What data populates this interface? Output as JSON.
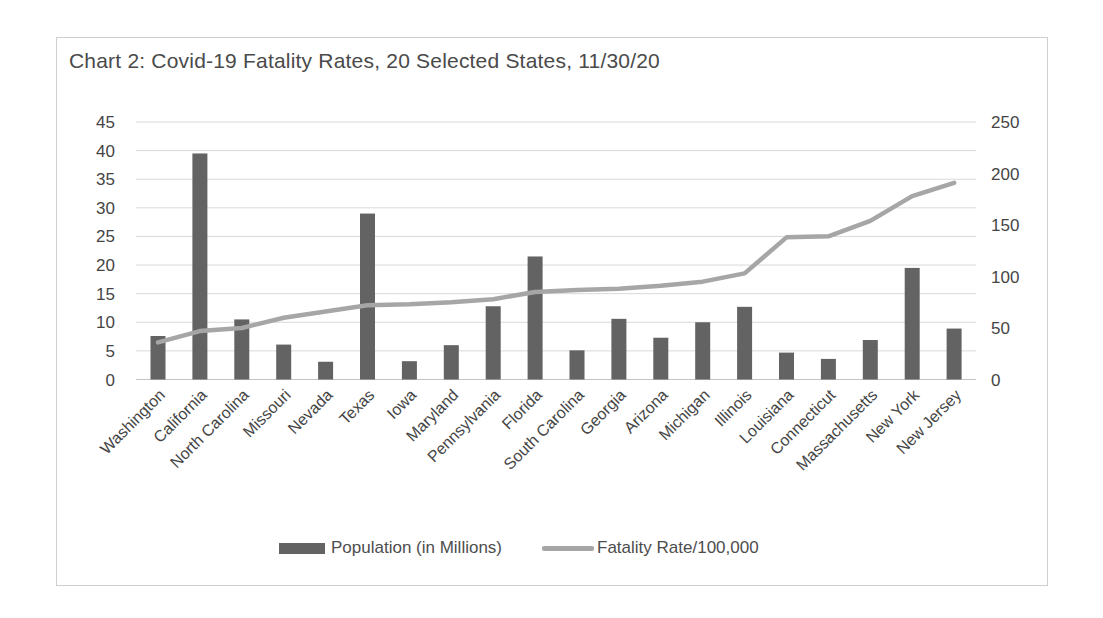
{
  "chart_data": {
    "type": "combo",
    "title": "Chart 2: Covid-19 Fatality Rates, 20 Selected States, 11/30/20",
    "categories": [
      "Washington",
      "California",
      "North Carolina",
      "Missouri",
      "Nevada",
      "Texas",
      "Iowa",
      "Maryland",
      "Pennsylvania",
      "Florida",
      "South Carolina",
      "Georgia",
      "Arizona",
      "Michigan",
      "Illinois",
      "Louisiana",
      "Connecticut",
      "Massachusetts",
      "New York",
      "New Jersey"
    ],
    "series": [
      {
        "name": "Population (in Millions)",
        "chart_type": "bar",
        "axis": "left",
        "color": "#636363",
        "values": [
          7.6,
          39.5,
          10.5,
          6.1,
          3.1,
          29,
          3.2,
          6,
          12.8,
          21.5,
          5.1,
          10.6,
          7.3,
          10,
          12.7,
          4.7,
          3.6,
          6.9,
          19.5,
          8.9
        ]
      },
      {
        "name": "Fatality Rate/100,000",
        "chart_type": "line",
        "axis": "right",
        "color": "#a6a6a6",
        "values": [
          36,
          47,
          50,
          60,
          66,
          72,
          73,
          75,
          78,
          85,
          87,
          88,
          91,
          95,
          103,
          138,
          139,
          154,
          178,
          191
        ]
      }
    ],
    "left_axis": {
      "min": 0,
      "max": 45,
      "step": 5,
      "ticks": [
        "0",
        "5",
        "10",
        "15",
        "20",
        "25",
        "30",
        "35",
        "40",
        "45"
      ]
    },
    "right_axis": {
      "min": 0,
      "max": 250,
      "step": 50,
      "ticks": [
        "0",
        "50",
        "100",
        "150",
        "200",
        "250"
      ]
    },
    "grid": true,
    "legend_position": "bottom",
    "colors": {
      "gridline": "#d9d9d9",
      "baseline": "#c3c3c3",
      "axis_text": "#454545",
      "title_text": "#4a4a4a",
      "frame_border": "#cfcfcf",
      "background": "#ffffff"
    }
  }
}
